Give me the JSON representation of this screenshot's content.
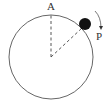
{
  "diagram": {
    "type": "circular-motion",
    "labels": {
      "top_point": "A",
      "ball": "P"
    },
    "circle": {
      "cx": 51,
      "cy": 57,
      "r": 42
    },
    "ball": {
      "cx": 85,
      "cy": 24,
      "r": 6
    },
    "rotation_direction": "clockwise",
    "colors": {
      "stroke": "#555555",
      "ball": "#111111",
      "dashed": "#444444"
    }
  }
}
